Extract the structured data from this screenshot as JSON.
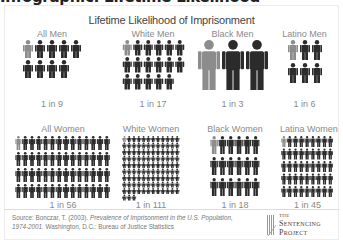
{
  "page_heading_partial": "Infographic: Lifetime Likelihood",
  "chart_data": {
    "type": "pictogram",
    "title": "Lifetime Likelihood of Imprisonment",
    "colors": {
      "highlight": "#8c8c8c",
      "base": "#2b2b2b"
    },
    "groups": [
      {
        "label": "All Men",
        "ratio": "1 in 9",
        "denominator": 9,
        "columns": 5
      },
      {
        "label": "White Men",
        "ratio": "1 in 17",
        "denominator": 17,
        "columns": 6
      },
      {
        "label": "Black Men",
        "ratio": "1 in 3",
        "denominator": 3,
        "columns": 3
      },
      {
        "label": "Latino Men",
        "ratio": "1 in 6",
        "denominator": 6,
        "columns": 3
      },
      {
        "label": "All Women",
        "ratio": "1 in 56",
        "denominator": 56,
        "columns": 14
      },
      {
        "label": "White Women",
        "ratio": "1 in 111",
        "denominator": 111,
        "columns": 12
      },
      {
        "label": "Black Women",
        "ratio": "1 in 18",
        "denominator": 18,
        "columns": 6
      },
      {
        "label": "Latina Women",
        "ratio": "1 in 45",
        "denominator": 45,
        "columns": 9
      }
    ]
  },
  "source": {
    "prefix": "Source: Bonczar, T. (2003). ",
    "title": "Prevalence of Imprisonment in the U.S. Population, 1974-2001.",
    "suffix": " Washington, D.C.: Bureau of Justice Statistics"
  },
  "logo": {
    "the": "THE",
    "line1": "Sentencing",
    "line2": "Project"
  }
}
